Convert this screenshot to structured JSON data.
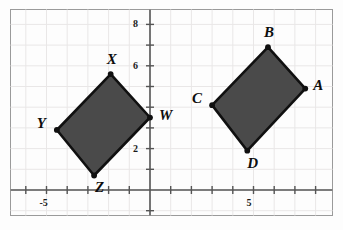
{
  "figure": {
    "background_color": "#fdfdfd",
    "border_color": "#9a9a9a",
    "grid_color": "#e9e7e7",
    "axis_color": "#555555",
    "shape_fill": "#4a4a4a",
    "shape_stroke": "#101010",
    "vertex_dot_color": "#101010"
  },
  "axes": {
    "x_axis_label": "",
    "y_axis_label": "",
    "x_range": [
      -7,
      9
    ],
    "y_range": [
      -1,
      9
    ],
    "grid": true,
    "x_tick_labels": [
      {
        "value": -5,
        "text": "-5"
      },
      {
        "value": 5,
        "text": "5"
      }
    ],
    "y_tick_labels": [
      {
        "value": 8,
        "text": "8"
      },
      {
        "value": 6,
        "text": "6"
      },
      {
        "value": 2,
        "text": "2"
      }
    ],
    "x_tick_values": [
      -6,
      -5,
      -4,
      -3,
      -2,
      -1,
      1,
      2,
      3,
      4,
      5,
      6,
      7,
      8
    ],
    "y_tick_values": [
      1,
      2,
      3,
      4,
      5,
      6,
      7,
      8,
      -1
    ]
  },
  "chart_data": {
    "type": "scatter",
    "title": "",
    "xlabel": "",
    "ylabel": "",
    "xlim": [
      -7,
      9
    ],
    "ylim": [
      -1,
      9
    ],
    "grid": true,
    "legend": "none",
    "shapes": [
      {
        "name": "quadrilateral-wxyz",
        "vertices": [
          {
            "label": "W",
            "x": 0.0,
            "y": 3.5,
            "label_dx": 9,
            "label_dy": -10
          },
          {
            "label": "X",
            "x": -1.9,
            "y": 5.6,
            "label_dx": -4,
            "label_dy": -22
          },
          {
            "label": "Y",
            "x": -4.5,
            "y": 2.9,
            "label_dx": -20,
            "label_dy": -14
          },
          {
            "label": "Z",
            "x": -2.7,
            "y": 0.7,
            "label_dx": 1,
            "label_dy": 4
          }
        ]
      },
      {
        "name": "quadrilateral-abcd",
        "vertices": [
          {
            "label": "A",
            "x": 7.5,
            "y": 4.9,
            "label_dx": 8,
            "label_dy": -11
          },
          {
            "label": "B",
            "x": 5.7,
            "y": 6.9,
            "label_dx": -4,
            "label_dy": -22
          },
          {
            "label": "C",
            "x": 3.0,
            "y": 4.1,
            "label_dx": -20,
            "label_dy": -14
          },
          {
            "label": "D",
            "x": 4.7,
            "y": 1.9,
            "label_dx": 0,
            "label_dy": 5
          }
        ]
      }
    ]
  }
}
